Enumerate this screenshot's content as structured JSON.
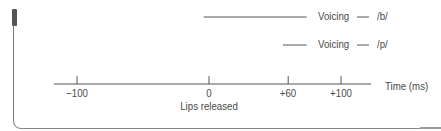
{
  "diagram": {
    "axis": {
      "label": "Time (ms)",
      "ticks": [
        {
          "value": -100,
          "label": "−100"
        },
        {
          "value": 0,
          "label": "0"
        },
        {
          "value": 60,
          "label": "+60"
        },
        {
          "value": 100,
          "label": "+100"
        }
      ],
      "annotation": "Lips released",
      "annotation_at": 0
    },
    "voicing": [
      {
        "label": "Voicing",
        "phoneme": "/b/",
        "start_ms": -4,
        "end_ms": 74
      },
      {
        "label": "Voicing",
        "phoneme": "/p/",
        "start_ms": 56,
        "end_ms": 74
      }
    ],
    "colors": {
      "line": "#555555",
      "text": "#4a4a4a"
    }
  }
}
